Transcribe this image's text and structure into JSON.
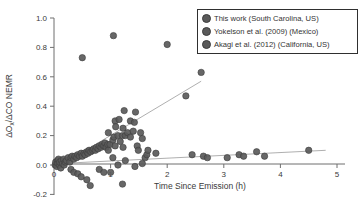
{
  "figure_type": "scatter-plot-figure",
  "colors": {
    "marker": "#5a5a5a",
    "marker_edge": "#3c3c3c",
    "trend_line": "#9a9a9a",
    "axis": "#6f6f6f",
    "text": "#3a3a3a",
    "legend_border": "#2f2f2f",
    "background": "#ffffff"
  },
  "chart_data": {
    "type": "scatter",
    "title": "",
    "xlabel": "Time Since Emission (h)",
    "ylabel": "ΔOx/ΔCO NEMR",
    "ylabel_parts": {
      "pre": "ΔO",
      "sub": "x",
      "post": "/ΔCO NEMR"
    },
    "xlim": [
      0,
      5.15
    ],
    "ylim": [
      -0.25,
      1.05
    ],
    "xticks": [
      0,
      1,
      2,
      3,
      4,
      5
    ],
    "yticks": [
      -0.2,
      0.0,
      0.2,
      0.4,
      0.6,
      0.8,
      1.0
    ],
    "grid": false,
    "legend_position": "top-right",
    "series": [
      {
        "name": "This work (South Carolina, US)",
        "color": "#5a5a5a",
        "points": [
          [
            0.02,
            0.0
          ],
          [
            0.03,
            0.02
          ],
          [
            0.05,
            -0.01
          ],
          [
            0.06,
            0.03
          ],
          [
            0.07,
            0.01
          ],
          [
            0.08,
            0.04
          ],
          [
            0.1,
            0.0
          ],
          [
            0.1,
            0.02
          ],
          [
            0.12,
            -0.02
          ],
          [
            0.13,
            0.03
          ],
          [
            0.15,
            0.01
          ],
          [
            0.17,
            0.04
          ],
          [
            0.18,
            0.0
          ],
          [
            0.2,
            0.02
          ],
          [
            0.22,
            0.03
          ],
          [
            0.25,
            0.05
          ],
          [
            0.28,
            0.02
          ],
          [
            0.3,
            0.05
          ],
          [
            0.3,
            -0.03
          ],
          [
            0.32,
            0.06
          ],
          [
            0.35,
            0.04
          ],
          [
            0.35,
            -0.05
          ],
          [
            0.37,
            0.06
          ],
          [
            0.4,
            0.05
          ],
          [
            0.42,
            -0.06
          ],
          [
            0.42,
            0.07
          ],
          [
            0.45,
            0.06
          ],
          [
            0.48,
            0.08
          ],
          [
            0.48,
            -0.08
          ],
          [
            0.5,
            0.06
          ],
          [
            0.53,
            0.08
          ],
          [
            0.55,
            0.07
          ],
          [
            0.58,
            0.09
          ],
          [
            0.58,
            -0.1
          ],
          [
            0.6,
            0.08
          ],
          [
            0.62,
            0.1
          ],
          [
            0.64,
            -0.14
          ],
          [
            0.65,
            0.09
          ],
          [
            0.68,
            0.1
          ],
          [
            0.7,
            0.11
          ],
          [
            0.73,
            0.1
          ],
          [
            0.75,
            0.12
          ],
          [
            0.78,
            0.11
          ],
          [
            0.8,
            0.13
          ],
          [
            0.8,
            -0.03
          ],
          [
            0.83,
            0.12
          ],
          [
            0.85,
            0.14
          ],
          [
            0.88,
            -0.05
          ],
          [
            0.88,
            0.13
          ],
          [
            0.9,
            0.15
          ],
          [
            0.92,
            0.12
          ],
          [
            0.95,
            0.14
          ],
          [
            0.96,
            0.1
          ],
          [
            0.96,
            0.22
          ],
          [
            0.99,
            0.14
          ],
          [
            1.0,
            -0.05
          ],
          [
            1.04,
            0.17
          ],
          [
            1.04,
            0.05
          ],
          [
            1.06,
            0.19
          ],
          [
            1.08,
            0.3
          ],
          [
            1.08,
            0.13
          ],
          [
            1.09,
            0.26
          ],
          [
            1.13,
            0.2
          ],
          [
            1.13,
            0.0
          ],
          [
            1.15,
            0.31
          ],
          [
            1.17,
            0.16
          ],
          [
            1.21,
            -0.13
          ],
          [
            1.21,
            0.2
          ],
          [
            1.22,
            0.25
          ],
          [
            1.22,
            0.12
          ],
          [
            1.24,
            0.37
          ],
          [
            1.26,
            0.2
          ],
          [
            1.26,
            0.03
          ],
          [
            1.3,
            0.22
          ],
          [
            1.35,
            0.3
          ],
          [
            1.35,
            0.19
          ],
          [
            1.4,
            0.23
          ],
          [
            1.42,
            0.29
          ],
          [
            1.43,
            -0.01
          ],
          [
            1.44,
            0.36
          ],
          [
            1.47,
            0.13
          ],
          [
            1.49,
            0.1
          ],
          [
            1.53,
            0.22
          ],
          [
            1.56,
            0.18
          ],
          [
            1.56,
            0.01
          ],
          [
            1.61,
            0.05
          ],
          [
            1.64,
            0.07
          ],
          [
            1.66,
            0.1
          ]
        ]
      },
      {
        "name": "Yokelson et al. (2009) (Mexico)",
        "color": "#5a5a5a",
        "points": [
          [
            0.5,
            0.73
          ],
          [
            1.05,
            0.88
          ],
          [
            2.0,
            0.82
          ],
          [
            2.33,
            0.47
          ],
          [
            2.6,
            0.63
          ]
        ]
      },
      {
        "name": "Akagi et al. (2012) (California, US)",
        "color": "#5a5a5a",
        "points": [
          [
            1.8,
            0.08
          ],
          [
            2.44,
            0.07
          ],
          [
            2.64,
            0.06
          ],
          [
            2.71,
            0.05
          ],
          [
            3.06,
            0.05
          ],
          [
            3.27,
            0.07
          ],
          [
            3.35,
            0.06
          ],
          [
            3.58,
            0.09
          ],
          [
            3.72,
            0.06
          ],
          [
            4.5,
            0.1
          ]
        ]
      }
    ],
    "fit_lines": [
      {
        "name": "steep-trend",
        "x1": 0.3,
        "y1": 0.04,
        "x2": 2.6,
        "y2": 0.57
      },
      {
        "name": "shallow-trend",
        "x1": 0.1,
        "y1": 0.01,
        "x2": 4.8,
        "y2": 0.1
      }
    ]
  }
}
